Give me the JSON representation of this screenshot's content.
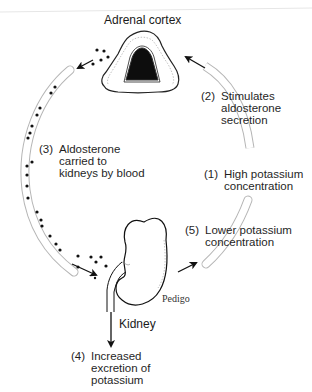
{
  "diagram": {
    "title": "Adrenal cortex",
    "organ_label": "Kidney",
    "signature": "Pedigo",
    "steps": [
      {
        "num": "(1)",
        "lines": [
          "High potassium",
          "concentration"
        ]
      },
      {
        "num": "(2)",
        "lines": [
          "Stimulates",
          "aldosterone",
          "secretion"
        ]
      },
      {
        "num": "(3)",
        "lines": [
          "Aldosterone",
          "carried to",
          "kidneys by blood"
        ]
      },
      {
        "num": "(4)",
        "lines": [
          "Increased",
          "excretion of",
          "potassium"
        ]
      },
      {
        "num": "(5)",
        "lines": [
          "Lower potassium",
          "concentration"
        ]
      }
    ],
    "colors": {
      "vessel_outline": "#b5b5b5",
      "ink": "#111111",
      "gland_medulla": "#0d0d0d"
    }
  }
}
